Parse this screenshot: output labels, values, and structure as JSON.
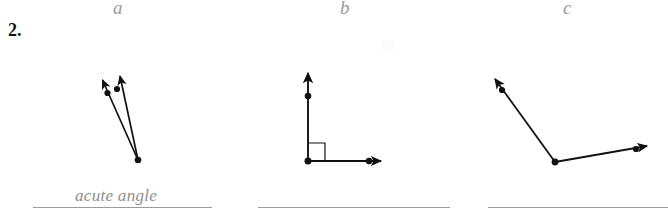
{
  "worksheet": {
    "problem_number": "2.",
    "parts": [
      {
        "key": "a",
        "label": "a",
        "figure": "acute-angle-two-rays",
        "answer_value": "acute angle",
        "answer_filled": true
      },
      {
        "key": "b",
        "label": "b",
        "figure": "right-angle-with-square-marker",
        "answer_value": "",
        "answer_filled": false
      },
      {
        "key": "c",
        "label": "c",
        "figure": "obtuse-angle-two-rays",
        "answer_value": "",
        "answer_filled": false
      }
    ],
    "colors": {
      "ink": "#101010",
      "pencil_grey": "#8f8f8f",
      "rule_line": "#9b9b9b",
      "paper": "#ffffff"
    }
  }
}
